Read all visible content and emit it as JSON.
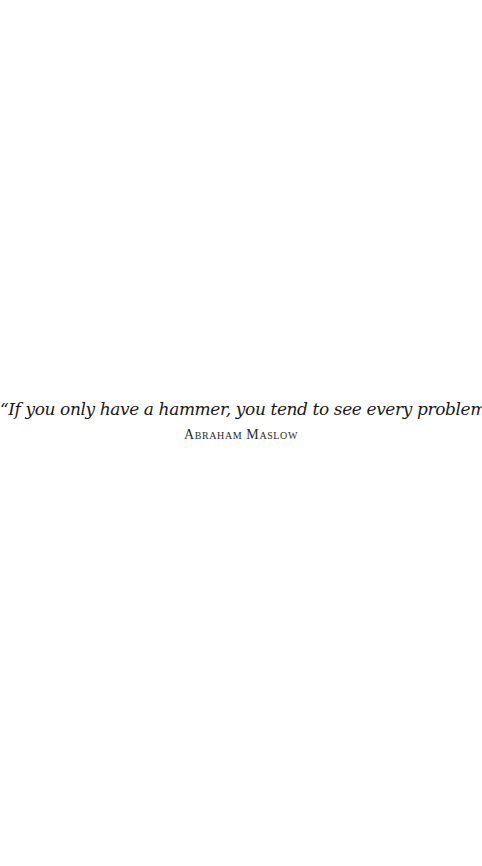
{
  "quote": {
    "text": "“If you only have a hammer, you tend to see every problem as a nail.”",
    "author": "Abraham Maslow"
  }
}
